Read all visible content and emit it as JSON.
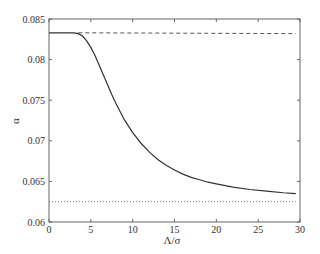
{
  "chart_data": {
    "type": "line",
    "title": "",
    "xlabel": "Λ/σ",
    "ylabel": "α",
    "xlim": [
      0,
      30
    ],
    "ylim": [
      0.06,
      0.085
    ],
    "xticks": [
      0,
      5,
      10,
      15,
      20,
      25,
      30
    ],
    "xtick_labels": [
      "0",
      "5",
      "10",
      "15",
      "20",
      "25",
      "30"
    ],
    "yticks": [
      0.06,
      0.065,
      0.07,
      0.075,
      0.08,
      0.085
    ],
    "ytick_labels": [
      "0.06",
      "0.065",
      "0.07",
      "0.075",
      "0.08",
      "0.085"
    ],
    "grid": false,
    "legend": null,
    "series": [
      {
        "name": "alpha",
        "style": "solid",
        "color": "#333333",
        "x": [
          0,
          1,
          2,
          3,
          3.5,
          4,
          4.5,
          5,
          5.5,
          6,
          6.5,
          7,
          7.5,
          8,
          9,
          10,
          11,
          12,
          13,
          14,
          15,
          16,
          17,
          18,
          19,
          20,
          22,
          24,
          26,
          28,
          29.5
        ],
        "y": [
          0.0833,
          0.0833,
          0.0833,
          0.0833,
          0.0832,
          0.0829,
          0.0823,
          0.0815,
          0.0805,
          0.0793,
          0.0781,
          0.0769,
          0.0757,
          0.0746,
          0.0726,
          0.071,
          0.0697,
          0.0686,
          0.0677,
          0.067,
          0.0664,
          0.0659,
          0.0655,
          0.0652,
          0.0649,
          0.0647,
          0.0643,
          0.064,
          0.0638,
          0.0636,
          0.0635
        ]
      },
      {
        "name": "upper-limit",
        "style": "dashed",
        "color": "#555555",
        "x": [
          3.5,
          29.5
        ],
        "y": [
          0.0833,
          0.0832
        ]
      },
      {
        "name": "lower-limit",
        "style": "dotted",
        "color": "#777777",
        "x": [
          0,
          29.5
        ],
        "y": [
          0.0625,
          0.0625
        ]
      }
    ]
  }
}
